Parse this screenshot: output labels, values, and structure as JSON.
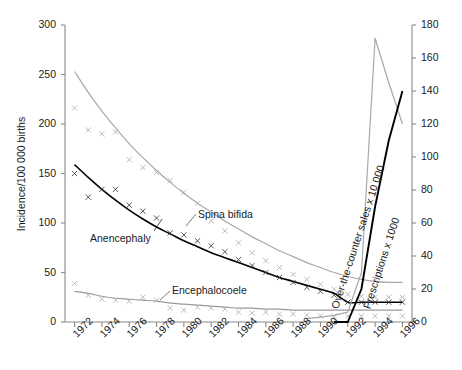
{
  "chart_data": {
    "type": "line",
    "title": "",
    "xlabel": "",
    "ylabel": "Incidence/100 000 births",
    "ylabel_right": "",
    "xlim": [
      1971.3,
      1996.7
    ],
    "ylim": [
      0,
      300
    ],
    "ylim_right": [
      0,
      180
    ],
    "grid": false,
    "legend": "inline-annotations",
    "xticks": [
      "1972",
      "1974",
      "1976",
      "1978",
      "1980",
      "1982",
      "1984",
      "1986",
      "1988",
      "1990",
      "1992",
      "1994",
      "1996"
    ],
    "xtick_values": [
      1972,
      1974,
      1976,
      1978,
      1980,
      1982,
      1984,
      1986,
      1988,
      1990,
      1992,
      1994,
      1996
    ],
    "yticks_left": [
      "0",
      "50",
      "100",
      "150",
      "200",
      "250",
      "300"
    ],
    "ytick_values_left": [
      0,
      50,
      100,
      150,
      200,
      250,
      300
    ],
    "yticks_right": [
      "0",
      "20",
      "40",
      "60",
      "80",
      "100",
      "120",
      "140",
      "160",
      "180"
    ],
    "ytick_values_right": [
      0,
      20,
      40,
      60,
      80,
      100,
      120,
      140,
      160,
      180
    ],
    "x": [
      1972,
      1973,
      1974,
      1975,
      1976,
      1977,
      1978,
      1979,
      1980,
      1981,
      1982,
      1983,
      1984,
      1985,
      1986,
      1987,
      1988,
      1989,
      1990,
      1991,
      1992,
      1993,
      1994,
      1995,
      1996
    ],
    "series": [
      {
        "name": "Spina bifida",
        "axis": "left",
        "color": "#a8a8a8",
        "marker": "x",
        "label_x": 1982.0,
        "label_y": 108,
        "points": [
          216,
          194,
          190,
          192,
          164,
          156,
          151,
          143,
          131,
          120,
          102,
          92,
          80,
          70,
          62,
          55,
          48,
          43,
          38,
          33,
          28,
          26,
          25,
          25,
          25
        ],
        "fit": [
          253,
          232,
          213,
          196,
          180,
          166,
          153,
          141,
          130,
          120,
          111,
          102,
          94,
          86,
          79,
          72,
          66,
          60,
          55,
          50,
          46,
          43,
          41,
          40,
          40
        ]
      },
      {
        "name": "Anencephaly",
        "axis": "left",
        "color": "#000000",
        "marker": "x",
        "label_x": 1974.2,
        "label_y": 83,
        "points": [
          150,
          126,
          134,
          134,
          118,
          112,
          105,
          90,
          88,
          82,
          77,
          71,
          63,
          57,
          50,
          45,
          40,
          35,
          31,
          27,
          20,
          20,
          20,
          20,
          20
        ],
        "fit": [
          159,
          146,
          134,
          123,
          113,
          104,
          96,
          89,
          82,
          76,
          70,
          65,
          60,
          55,
          50,
          45,
          41,
          37,
          33,
          29,
          20,
          20,
          20,
          20,
          20
        ]
      },
      {
        "name": "Encephalocoele",
        "axis": "left",
        "color": "#9a9a9a",
        "marker": "x",
        "label_x": 1981.0,
        "label_y": 35,
        "points": [
          39,
          27,
          23,
          22,
          21,
          25,
          22,
          14,
          12,
          15,
          14,
          13,
          10,
          9,
          10,
          8,
          8,
          7,
          6,
          6,
          6,
          6,
          6,
          6,
          6
        ],
        "fit": [
          31,
          29,
          26,
          24,
          23,
          22,
          21,
          19,
          18,
          17,
          16,
          15,
          14,
          14,
          13,
          13,
          12,
          12,
          12,
          12,
          12,
          12,
          12,
          12,
          12
        ]
      },
      {
        "name": "Over-the-counter sales x 10 000",
        "axis": "right",
        "color": "#a8a8a8",
        "marker": "none",
        "rotation": -72,
        "label_x": 1990.5,
        "label_y": 100,
        "x": [
          1989,
          1990,
          1991,
          1992,
          1993,
          1994,
          1995,
          1996
        ],
        "values": [
          2,
          3,
          4,
          6,
          30,
          172,
          145,
          120
        ]
      },
      {
        "name": "Prescriptions x 1000",
        "axis": "right",
        "color": "#000000",
        "marker": "none",
        "rotation": -72,
        "label_x": 1992.6,
        "label_y": 78,
        "x": [
          1991,
          1992,
          1993,
          1994,
          1995,
          1996
        ],
        "values": [
          0,
          0,
          20,
          70,
          110,
          140
        ]
      }
    ]
  },
  "labels": {
    "y_left": "Incidence/100 000 births",
    "spina_bifida": "Spina bifida",
    "anencephaly": "Anencephaly",
    "encephalocoele": "Encephalocoele",
    "otc_sales": "Over-the-counter sales x 10 000",
    "prescriptions": "Prescriptions x 1000"
  }
}
